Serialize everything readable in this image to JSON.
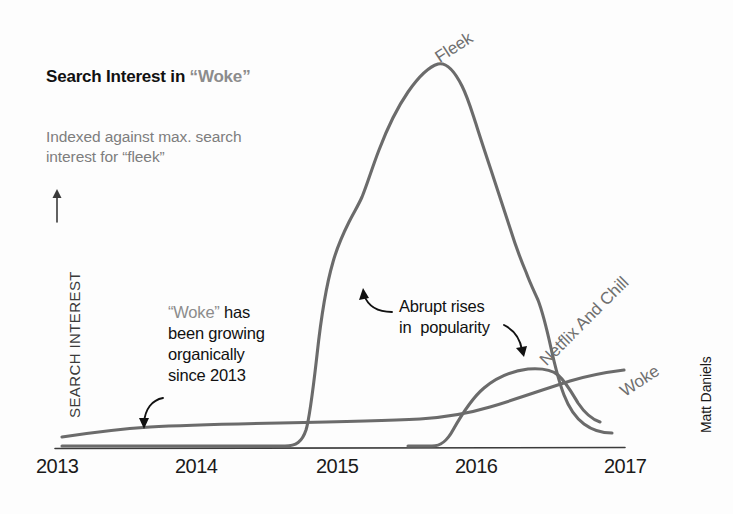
{
  "header": {
    "title_main": "Search Interest in ",
    "title_quoted": "“Woke”",
    "subtitle": "Indexed against max. search\ninterest for “fleek”"
  },
  "axes": {
    "y_label": "SEARCH INTEREST",
    "y_arrow": "→",
    "x_ticks": [
      "2013",
      "2014",
      "2015",
      "2016",
      "2017"
    ]
  },
  "annotations": {
    "woke_note_quoted": "“Woke”",
    "woke_note_rest": " has\nbeen growing\norganically\nsince 2013",
    "abrupt_note": "Abrupt rises\nin  popularity"
  },
  "series_labels": {
    "fleek": "Fleek",
    "netflix": "Netflix And Chill",
    "woke": "Woke"
  },
  "credit": "Matt Daniels",
  "colors": {
    "line": "#6b6b6b",
    "axis": "#3c3c3c",
    "title": "#111111",
    "muted": "#8c8c8c",
    "subtitle": "#7e7e7e",
    "annotation": "#111111",
    "background": "#fdfdfd"
  },
  "chart_data": {
    "type": "line",
    "title": "Search Interest in “Woke”",
    "subtitle": "Indexed against max. search interest for “fleek”",
    "xlabel": "",
    "ylabel": "SEARCH INTEREST",
    "xlim": [
      2013.0,
      2017.1
    ],
    "ylim": [
      0,
      100
    ],
    "x_ticks": [
      2013,
      2014,
      2015,
      2016,
      2017
    ],
    "y_ticks": [],
    "grid": false,
    "legend": "inline-labels",
    "note": "Values indexed so that max search interest for “fleek” = 100",
    "x": [
      2013.0,
      2013.1,
      2013.2,
      2013.3,
      2013.4,
      2013.5,
      2013.6,
      2013.7,
      2013.8,
      2013.9,
      2014.0,
      2014.1,
      2014.2,
      2014.3,
      2014.4,
      2014.5,
      2014.6,
      2014.7,
      2014.8,
      2014.9,
      2015.0,
      2015.1,
      2015.2,
      2015.3,
      2015.4,
      2015.5,
      2015.6,
      2015.7,
      2015.8,
      2015.9,
      2016.0,
      2016.1,
      2016.2,
      2016.3,
      2016.4,
      2016.5,
      2016.6,
      2016.7,
      2016.8,
      2016.9,
      2017.0
    ],
    "series": [
      {
        "name": "Fleek",
        "values": [
          0,
          0,
          0,
          0,
          0,
          0,
          0,
          0,
          0,
          0,
          0,
          0,
          0,
          0,
          0,
          0,
          1,
          2,
          6,
          24,
          46,
          55,
          60,
          66,
          73,
          82,
          91,
          97,
          100,
          97,
          92,
          84,
          76,
          68,
          60,
          52,
          44,
          36,
          28,
          20,
          14
        ]
      },
      {
        "name": "Netflix And Chill",
        "values": [
          0,
          0,
          0,
          0,
          0,
          0,
          0,
          0,
          0,
          0,
          0,
          0,
          0,
          0,
          0,
          0,
          0,
          0,
          0,
          0,
          0,
          0,
          0,
          0,
          0,
          0,
          0,
          1,
          3,
          8,
          14,
          19,
          23,
          25,
          26,
          26,
          25,
          23,
          20,
          17,
          14
        ]
      },
      {
        "name": "Woke",
        "values": [
          3,
          3,
          3,
          4,
          4,
          4,
          4,
          4,
          5,
          5,
          5,
          5,
          5,
          5,
          5,
          5,
          5,
          5,
          5,
          6,
          6,
          6,
          6,
          6,
          6,
          6,
          7,
          7,
          8,
          9,
          10,
          11,
          12,
          13,
          15,
          16,
          18,
          19,
          20,
          21,
          22
        ]
      }
    ],
    "callouts": [
      {
        "text": "“Woke” has been growing organically since 2013",
        "points_to": "Woke",
        "at_x": 2013.7
      },
      {
        "text": "Abrupt rises in popularity",
        "points_to": [
          "Fleek",
          "Netflix And Chill"
        ],
        "at_x": 2015.2
      }
    ]
  }
}
